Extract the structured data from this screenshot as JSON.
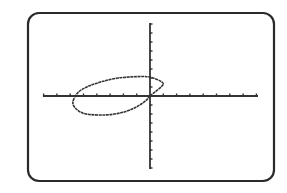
{
  "screen": {
    "frame": {
      "x": 28,
      "y": 13,
      "width": 246,
      "height": 168,
      "radius": 11,
      "stroke": "#2a2a2a",
      "stroke_width": 2.2
    },
    "background": "#ffffff",
    "ink": "#333333"
  },
  "chart_data": {
    "type": "line",
    "title": "",
    "xlabel": "",
    "ylabel": "",
    "xlim": [
      -8,
      8
    ],
    "ylim": [
      -8,
      8
    ],
    "xscale": 1,
    "yscale": 1,
    "grid": false,
    "axes": true,
    "series": [
      {
        "name": "ellipse",
        "kind": "parametric-ellipse",
        "center": [
          -2.45,
          0.0
        ],
        "semi_major": 3.4,
        "semi_minor": 1.55,
        "rotation_deg": 18,
        "points": [
          [
            0.0,
            0.0
          ],
          [
            0.9,
            1.1
          ],
          [
            0.9,
            1.55
          ],
          [
            0.0,
            2.1
          ],
          [
            -1.0,
            2.15
          ],
          [
            -2.4,
            2.0
          ],
          [
            -3.6,
            1.6
          ],
          [
            -4.6,
            1.1
          ],
          [
            -5.4,
            0.4
          ],
          [
            -5.8,
            -0.7
          ],
          [
            -5.5,
            -1.5
          ],
          [
            -4.8,
            -2.0
          ],
          [
            -3.3,
            -2.1
          ],
          [
            -2.0,
            -1.8
          ],
          [
            -1.0,
            -1.2
          ],
          [
            -0.3,
            -0.5
          ],
          [
            0.0,
            0.0
          ]
        ]
      }
    ]
  },
  "plot_area": {
    "origin_px": [
      150,
      96
    ],
    "x_unit_px": 13.3,
    "y_unit_px": 9.0,
    "x_axis_px": [
      43,
      258
    ],
    "y_axis_px": [
      23,
      169
    ],
    "tick_len_px": 2.5
  }
}
